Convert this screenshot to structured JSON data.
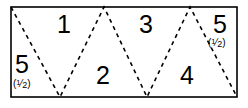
{
  "figure": {
    "canvas": {
      "width": 248,
      "height": 108
    },
    "colors": {
      "background": "#ffffff",
      "rectangle_stroke": "#000000",
      "zigzag_stroke": "#000000",
      "label_text": "#000000"
    },
    "rectangle": {
      "x": 11,
      "y": 7,
      "width": 226,
      "height": 90,
      "stroke_width": 1.6,
      "fill": "none"
    },
    "zigzag": {
      "style": "dashed",
      "dash_pattern": "4 4",
      "stroke_width": 1.6,
      "points": [
        {
          "x": 11,
          "y": 7
        },
        {
          "x": 60,
          "y": 97
        },
        {
          "x": 104,
          "y": 7
        },
        {
          "x": 147,
          "y": 97
        },
        {
          "x": 190,
          "y": 7
        },
        {
          "x": 237,
          "y": 97
        }
      ]
    },
    "labels": [
      {
        "id": "region-1",
        "text": "1",
        "x": 57,
        "y": 12,
        "size": "big"
      },
      {
        "id": "region-2",
        "text": "2",
        "x": 96,
        "y": 63,
        "size": "big"
      },
      {
        "id": "region-3",
        "text": "3",
        "x": 139,
        "y": 12,
        "size": "big"
      },
      {
        "id": "region-4",
        "text": "4",
        "x": 180,
        "y": 63,
        "size": "big"
      },
      {
        "id": "region-5-left",
        "text": "5",
        "x": 15,
        "y": 52,
        "size": "big"
      },
      {
        "id": "region-5-right",
        "text": "5",
        "x": 213,
        "y": 12,
        "size": "big"
      }
    ],
    "half_notes": [
      {
        "id": "half-note-left",
        "open": "(",
        "numerator": "1",
        "bar": "⁄",
        "denominator": "2",
        "close": ")",
        "x": 13,
        "y": 79
      },
      {
        "id": "half-note-right",
        "open": "(",
        "numerator": "1",
        "bar": "⁄",
        "denominator": "2",
        "close": ")",
        "x": 208,
        "y": 38
      }
    ]
  }
}
